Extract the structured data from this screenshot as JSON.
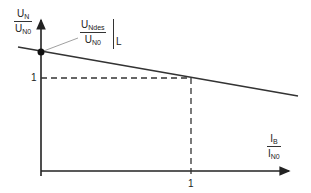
{
  "diagram": {
    "y_axis_label": {
      "numerator_main": "U",
      "numerator_sub": "N",
      "denominator_main": "U",
      "denominator_sub": "N0"
    },
    "x_axis_label": {
      "numerator_main": "I",
      "numerator_sub": "B",
      "denominator_main": "I",
      "denominator_sub": "N0"
    },
    "annotation": {
      "numerator_main": "U",
      "numerator_sub": "Ndes",
      "denominator_main": "U",
      "denominator_sub": "N0",
      "evaluated_at": "L"
    },
    "y_tick": "1",
    "x_tick": "1",
    "colors": {
      "line": "#333333",
      "background": "#ffffff"
    }
  }
}
